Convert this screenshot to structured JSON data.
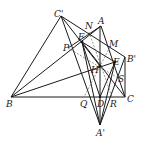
{
  "diagram": {
    "type": "geometry-figure",
    "points": {
      "Cp": {
        "label": "C'",
        "x": 61,
        "y": 16
      },
      "A": {
        "label": "A",
        "x": 101,
        "y": 26
      },
      "N": {
        "label": "N",
        "x": 89,
        "y": 32
      },
      "F": {
        "label": "F",
        "x": 82,
        "y": 42
      },
      "M": {
        "label": "M",
        "x": 110,
        "y": 47
      },
      "P": {
        "label": "P",
        "x": 68,
        "y": 48
      },
      "Bp": {
        "label": "B'",
        "x": 125,
        "y": 57
      },
      "E": {
        "label": "E",
        "x": 115,
        "y": 62
      },
      "H": {
        "label": "H",
        "x": 100,
        "y": 66
      },
      "S": {
        "label": "S",
        "x": 118,
        "y": 78
      },
      "B": {
        "label": "B",
        "x": 11,
        "y": 97
      },
      "Q": {
        "label": "Q",
        "x": 84,
        "y": 97
      },
      "D": {
        "label": "D",
        "x": 100,
        "y": 97
      },
      "R": {
        "label": "R",
        "x": 112,
        "y": 97
      },
      "C": {
        "label": "C",
        "x": 125,
        "y": 97
      },
      "Ap": {
        "label": "A'",
        "x": 100,
        "y": 125
      }
    },
    "labels": {
      "Cp": "C'",
      "A": "A",
      "N": "N",
      "F": "F",
      "M": "M",
      "P": "P",
      "Bp": "B'",
      "E": "E",
      "H": "H",
      "S": "S",
      "B": "B",
      "Q": "Q",
      "D": "D",
      "R": "R",
      "C": "C",
      "Ap": "A'"
    },
    "stroke_color": "#1a1a1a",
    "dashed_color": "#555555"
  }
}
